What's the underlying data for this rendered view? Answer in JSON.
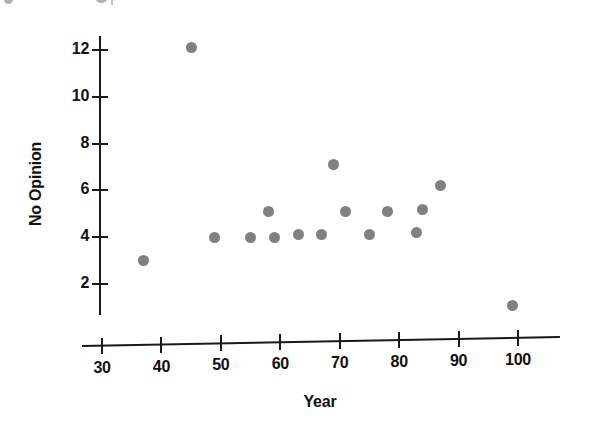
{
  "chart_data": {
    "type": "scatter",
    "title": "",
    "xlabel": "Year",
    "ylabel": "No Opinion",
    "xlim": [
      30,
      105
    ],
    "ylim": [
      0.4,
      12.8
    ],
    "grid": false,
    "legend": null,
    "marker_color": "#808080",
    "axis_color": "#1a1a1a",
    "xticks": [
      30,
      40,
      50,
      60,
      70,
      80,
      90,
      100
    ],
    "xtick_labels": [
      "30",
      "40",
      "50",
      "60",
      "70",
      "80",
      "90",
      "100"
    ],
    "yticks": [
      2,
      4,
      6,
      8,
      10,
      12
    ],
    "ytick_labels": [
      "2",
      "4",
      "6",
      "8",
      "10",
      "12"
    ],
    "points": [
      {
        "x": 37,
        "y": 3.0
      },
      {
        "x": 45,
        "y": 12.1
      },
      {
        "x": 49,
        "y": 4.0
      },
      {
        "x": 55,
        "y": 4.0
      },
      {
        "x": 58,
        "y": 5.1
      },
      {
        "x": 59,
        "y": 4.0
      },
      {
        "x": 63,
        "y": 4.1
      },
      {
        "x": 67,
        "y": 4.1
      },
      {
        "x": 69,
        "y": 7.1
      },
      {
        "x": 71,
        "y": 5.1
      },
      {
        "x": 75,
        "y": 4.1
      },
      {
        "x": 78,
        "y": 5.1
      },
      {
        "x": 83,
        "y": 4.2
      },
      {
        "x": 84,
        "y": 5.2
      },
      {
        "x": 87,
        "y": 6.2
      },
      {
        "x": 99,
        "y": 1.1
      }
    ]
  },
  "geometry": {
    "x_axis_px_at_xmin": 102,
    "x_axis_px_per_unit": 5.943,
    "y_axis_px_at_2": 284,
    "y_axis_px_per_unit": 23.4,
    "y_axis_x_px": 99,
    "x_axis_y_px_left": 345,
    "x_axis_y_px_right": 336,
    "y_axis_top_px": 36,
    "y_axis_bottom_px": 315,
    "x_axis_left_px": 82,
    "x_axis_right_px": 560,
    "x_title_center_px": 320,
    "x_title_y_px": 393,
    "y_title_center_x_px": 36,
    "y_title_center_y_px": 185
  }
}
